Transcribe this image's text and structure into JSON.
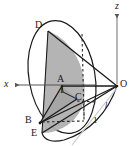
{
  "figure": {
    "kind": "3d-cone-geometry-diagram",
    "background_color": "#ffffff",
    "stroke_color": "#1a1a1a",
    "shaded_face_color": "#b0b0b0",
    "shaded_face_color_dark": "#9a9a9a",
    "axis_color": "#555555",
    "dashed_color": "#2a2a2a"
  },
  "axes": [
    {
      "name": "x-axis",
      "label": "x",
      "direction": "left",
      "label_x": 5,
      "label_y": 80
    },
    {
      "name": "z-axis",
      "label": "z",
      "direction": "up",
      "label_x": 116,
      "label_y": 3
    }
  ],
  "points": [
    {
      "id": "D",
      "label": "D",
      "label_x": 36,
      "label_y": 22,
      "px": 48,
      "py": 31
    },
    {
      "id": "A",
      "label": "A",
      "label_x": 58,
      "label_y": 76,
      "px": 62,
      "py": 86
    },
    {
      "id": "I",
      "label": "I",
      "label_x": 60,
      "label_y": 86,
      "px": 63,
      "py": 92
    },
    {
      "id": "C",
      "label": "C",
      "label_x": 76,
      "label_y": 93,
      "px": 77,
      "py": 99
    },
    {
      "id": "B",
      "label": "B",
      "label_x": 26,
      "label_y": 116,
      "px": 40,
      "py": 123
    },
    {
      "id": "E",
      "label": "E",
      "label_x": 31,
      "label_y": 128,
      "px": 42,
      "py": 133
    },
    {
      "id": "O",
      "label": "O",
      "label_x": 120,
      "label_y": 80,
      "px": 117,
      "py": 86
    }
  ],
  "measures": [
    {
      "id": "unit-length",
      "label": "1",
      "label_x": 94,
      "label_y": 117,
      "style": "plain"
    },
    {
      "id": "slant-length",
      "label": "l",
      "label_x": 105,
      "label_y": 103,
      "style": "italic"
    }
  ],
  "shapes": {
    "base_ellipse": {
      "cx": 62,
      "cy": 77,
      "rx": 33,
      "ry": 57,
      "rotation_deg": -10
    },
    "apex": {
      "x": 117,
      "y": 86
    },
    "shaded_region": "axial-half-section A-B-D-E arc"
  }
}
